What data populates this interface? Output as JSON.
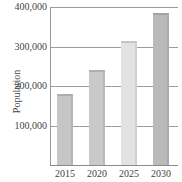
{
  "chart_data": {
    "type": "bar",
    "title": "",
    "xlabel": "",
    "ylabel": "Population",
    "categories": [
      "2015",
      "2020",
      "2025",
      "2030"
    ],
    "values": [
      180000,
      240000,
      315000,
      385000
    ],
    "ylim": [
      0,
      400000
    ],
    "yticks": [
      "100,000",
      "200,000",
      "300,000",
      "400,000"
    ],
    "grid": true,
    "legend": null,
    "bar_colors": [
      "#c6c6c6",
      "#c9c9c9",
      "#e2e2e2",
      "#bababa"
    ]
  }
}
